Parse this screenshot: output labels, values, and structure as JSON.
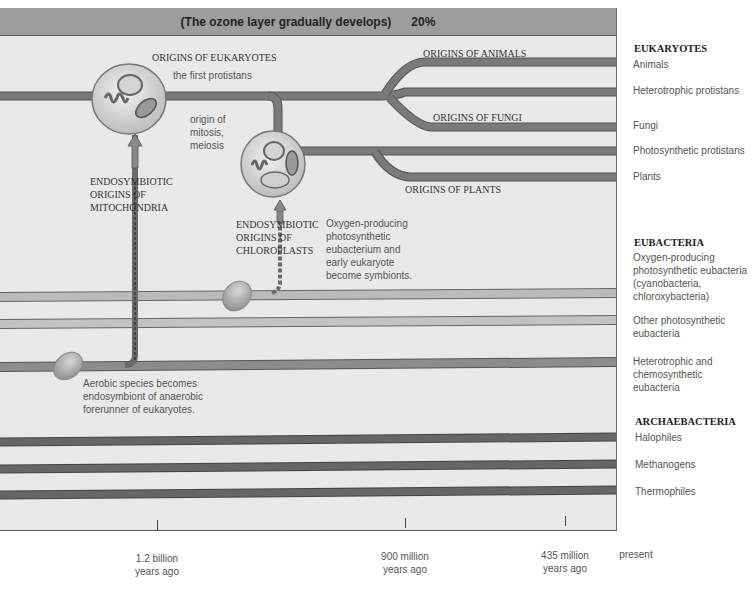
{
  "banner": {
    "text": "(The ozone layer gradually develops)",
    "percent": "20%"
  },
  "annotations": {
    "origins_eukaryotes": "ORIGINS OF EUKARYOTES",
    "first_protistans": "the first protistans",
    "origin_mitosis": [
      "origin of",
      "mitosis,",
      "meiosis"
    ],
    "endo_mito": [
      "ENDOSYMBIOTIC",
      "ORIGINS OF",
      "MITOCHONDRIA"
    ],
    "endo_chloro": [
      "ENDOSYMBIOTIC",
      "ORIGINS OF",
      "CHLOROPLASTS"
    ],
    "oxygen_symbionts": [
      "Oxygen-producing",
      "photosynthetic",
      "eubacterium and",
      "early eukaryote",
      "become symbionts."
    ],
    "aerobic": [
      "Aerobic species becomes",
      "endosymbiont of anaerobic",
      "forerunner of eukaryotes."
    ],
    "origins_animals": "ORIGINS OF ANIMALS",
    "origins_fungi": "ORIGINS OF FUNGI",
    "origins_plants": "ORIGINS OF PLANTS"
  },
  "legend": {
    "eukaryotes": {
      "title": "EUKARYOTES",
      "items": [
        "Animals",
        "Heterotrophic protistans",
        "Fungi",
        "Photosynthetic protistans",
        "Plants"
      ]
    },
    "eubacteria": {
      "title": "EUBACTERIA",
      "items": [
        [
          "Oxygen-producing",
          "photosynthetic eubacteria",
          "(cyanobacteria,",
          "chloroxybacteria)"
        ],
        [
          "Other photosynthetic",
          "eubacteria"
        ],
        [
          "Heterotrophic and",
          "chemosynthetic",
          "eubacteria"
        ]
      ]
    },
    "archaebacteria": {
      "title": "ARCHAEBACTERIA",
      "items": [
        "Halophiles",
        "Methanogens",
        "Thermophiles"
      ]
    }
  },
  "timeline": [
    {
      "label": [
        "1.2 billion",
        "years ago"
      ],
      "x": 157
    },
    {
      "label": [
        "900 million",
        "years ago"
      ],
      "x": 405
    },
    {
      "label": [
        "435 million",
        "years ago"
      ],
      "x": 565
    },
    {
      "label": [
        "present"
      ],
      "x": 636
    }
  ],
  "colors": {
    "panel": "#e9e9e9",
    "banner": "#9d9d9d",
    "dark_line": "#666666",
    "mid_line": "#8a8a8a",
    "light_line": "#b8b8b8"
  }
}
